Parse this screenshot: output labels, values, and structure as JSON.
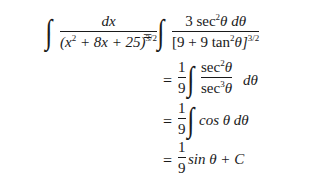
{
  "equation": {
    "line1": {
      "lhs_num": "dx",
      "lhs_den_base": "(x",
      "lhs_den_exp1": "2",
      "lhs_den_rest": " + 8x + 25)",
      "lhs_den_exp2": "3/2",
      "eq": "=",
      "rhs_num_coef": "3 sec",
      "rhs_num_exp": "2",
      "rhs_num_rest": "θ dθ",
      "rhs_den_base": "[9 + 9 tan",
      "rhs_den_exp1": "2",
      "rhs_den_rest": "θ]",
      "rhs_den_exp2": "3/2"
    },
    "line2": {
      "eq": "=",
      "coef_num": "1",
      "coef_den": "9",
      "num_base": "sec",
      "num_exp": "2",
      "num_var": "θ",
      "den_base": "sec",
      "den_exp": "3",
      "den_var": "θ",
      "diff": "dθ"
    },
    "line3": {
      "eq": "=",
      "coef_num": "1",
      "coef_den": "9",
      "body": "cos θ dθ"
    },
    "line4": {
      "eq": "=",
      "coef_num": "1",
      "coef_den": "9",
      "body": "sin θ + C"
    },
    "integral_symbol": "∫"
  }
}
